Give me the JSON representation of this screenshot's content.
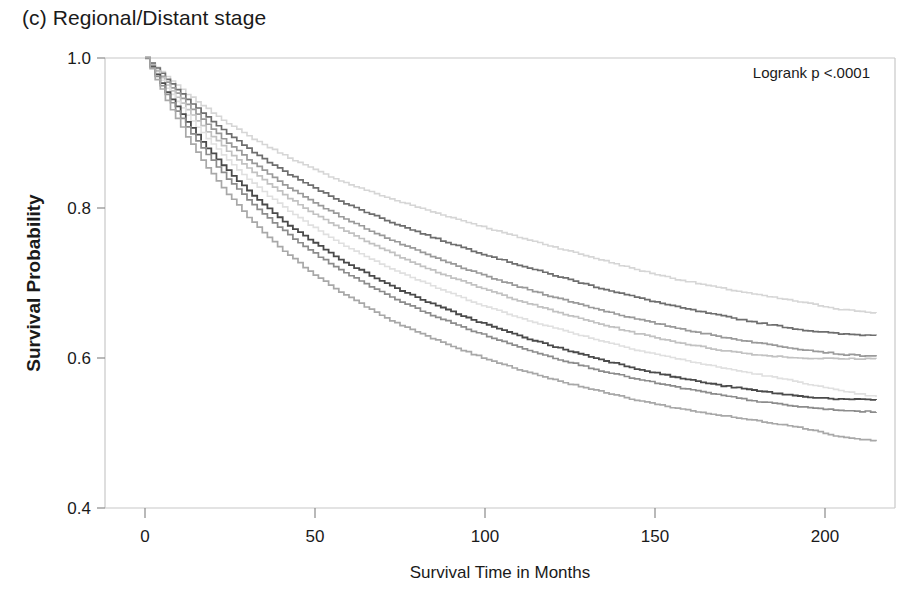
{
  "figure": {
    "panel_title": "(c) Regional/Distant stage",
    "annotation": "Logrank p <.0001"
  },
  "chart_data": {
    "type": "line",
    "title": "(c) Regional/Distant stage",
    "subtitle": "",
    "xlabel": "Survival Time in Months",
    "ylabel": "Survival Probability",
    "xlim": [
      0,
      215
    ],
    "ylim": [
      0.4,
      1.0
    ],
    "xticks": [
      0,
      50,
      100,
      150,
      200
    ],
    "xtick_labels": [
      "0",
      "50",
      "100",
      "150",
      "200"
    ],
    "yticks": [
      0.4,
      0.6,
      0.8,
      1.0
    ],
    "ytick_labels": [
      "0.4",
      "0.6",
      "0.8",
      "1.0"
    ],
    "grid": false,
    "legend": "none",
    "legend_position": "none",
    "annotations": [
      {
        "text": "Logrank p <.0001",
        "x": 175,
        "y": 0.975
      }
    ],
    "step_curves": true,
    "x": [
      0,
      6,
      12,
      18,
      24,
      30,
      36,
      42,
      48,
      54,
      60,
      72,
      84,
      96,
      108,
      120,
      132,
      144,
      156,
      168,
      180,
      192,
      204,
      215
    ],
    "series": [
      {
        "name": "curve-1",
        "color": "#d6d6d6",
        "linewidth": 1.6,
        "values": [
          1.0,
          0.975,
          0.952,
          0.932,
          0.913,
          0.896,
          0.881,
          0.867,
          0.854,
          0.842,
          0.831,
          0.812,
          0.795,
          0.779,
          0.763,
          0.748,
          0.733,
          0.718,
          0.705,
          0.694,
          0.684,
          0.675,
          0.665,
          0.66
        ]
      },
      {
        "name": "curve-2",
        "color": "#6e6e6e",
        "linewidth": 1.7,
        "values": [
          1.0,
          0.972,
          0.945,
          0.921,
          0.899,
          0.879,
          0.861,
          0.845,
          0.83,
          0.816,
          0.803,
          0.781,
          0.761,
          0.743,
          0.726,
          0.71,
          0.695,
          0.681,
          0.668,
          0.657,
          0.647,
          0.638,
          0.632,
          0.63
        ]
      },
      {
        "name": "curve-3",
        "color": "#9a9a9a",
        "linewidth": 1.7,
        "values": [
          1.0,
          0.968,
          0.938,
          0.911,
          0.887,
          0.865,
          0.845,
          0.827,
          0.811,
          0.796,
          0.782,
          0.757,
          0.735,
          0.715,
          0.697,
          0.681,
          0.666,
          0.652,
          0.64,
          0.629,
          0.62,
          0.612,
          0.605,
          0.602
        ]
      },
      {
        "name": "curve-4",
        "color": "#c2c2c2",
        "linewidth": 1.7,
        "values": [
          1.0,
          0.964,
          0.931,
          0.902,
          0.876,
          0.853,
          0.832,
          0.813,
          0.796,
          0.78,
          0.766,
          0.74,
          0.717,
          0.697,
          0.679,
          0.662,
          0.647,
          0.633,
          0.621,
          0.611,
          0.604,
          0.6,
          0.599,
          0.599
        ]
      },
      {
        "name": "curve-5",
        "color": "#e0e0e0",
        "linewidth": 1.6,
        "values": [
          1.0,
          0.96,
          0.924,
          0.892,
          0.864,
          0.839,
          0.816,
          0.796,
          0.778,
          0.761,
          0.746,
          0.719,
          0.696,
          0.675,
          0.656,
          0.64,
          0.625,
          0.611,
          0.599,
          0.588,
          0.578,
          0.568,
          0.556,
          0.548
        ]
      },
      {
        "name": "curve-6",
        "color": "#4a4a4a",
        "linewidth": 1.8,
        "values": [
          1.0,
          0.955,
          0.915,
          0.88,
          0.85,
          0.823,
          0.799,
          0.777,
          0.758,
          0.74,
          0.724,
          0.696,
          0.672,
          0.651,
          0.632,
          0.615,
          0.6,
          0.586,
          0.574,
          0.564,
          0.556,
          0.549,
          0.545,
          0.544
        ]
      },
      {
        "name": "curve-7",
        "color": "#8c8c8c",
        "linewidth": 1.7,
        "values": [
          1.0,
          0.951,
          0.908,
          0.871,
          0.839,
          0.811,
          0.786,
          0.764,
          0.744,
          0.726,
          0.71,
          0.681,
          0.657,
          0.636,
          0.617,
          0.6,
          0.585,
          0.572,
          0.561,
          0.551,
          0.542,
          0.535,
          0.53,
          0.528
        ]
      },
      {
        "name": "curve-8",
        "color": "#a8a8a8",
        "linewidth": 1.7,
        "values": [
          1.0,
          0.944,
          0.895,
          0.854,
          0.819,
          0.788,
          0.761,
          0.737,
          0.716,
          0.697,
          0.68,
          0.65,
          0.626,
          0.605,
          0.587,
          0.571,
          0.557,
          0.544,
          0.533,
          0.524,
          0.516,
          0.508,
          0.495,
          0.489
        ]
      }
    ]
  }
}
